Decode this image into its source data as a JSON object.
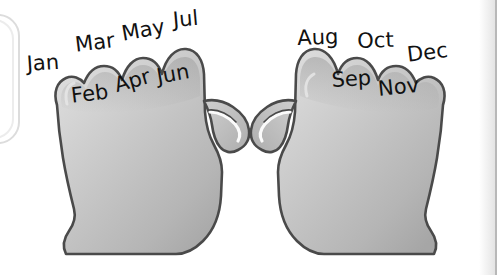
{
  "figure": {
    "colors": {
      "hand_fill_light": "#d2d2d2",
      "hand_fill_mid": "#bdbdbd",
      "hand_fill_dark": "#a8a8a8",
      "hand_outline": "#4a4a4a",
      "label_text": "#111111",
      "background": "#ffffff",
      "page_rule": "#b8b8b8"
    }
  },
  "left_hand": {
    "name": "left-fist",
    "labels": [
      {
        "id": "jan",
        "text": "Jan",
        "x": 26,
        "y": 54,
        "size": 21,
        "rotate": -4,
        "position": "knuckle"
      },
      {
        "id": "feb",
        "text": "Feb",
        "x": 70,
        "y": 86,
        "size": 21,
        "rotate": -7,
        "position": "valley"
      },
      {
        "id": "mar",
        "text": "Mar",
        "x": 74,
        "y": 35,
        "size": 21,
        "rotate": -7,
        "position": "knuckle"
      },
      {
        "id": "apr",
        "text": "Apr",
        "x": 112,
        "y": 76,
        "size": 21,
        "rotate": -16,
        "position": "valley"
      },
      {
        "id": "may",
        "text": "May",
        "x": 120,
        "y": 24,
        "size": 21,
        "rotate": -10,
        "position": "knuckle"
      },
      {
        "id": "jun",
        "text": "Jun",
        "x": 155,
        "y": 67,
        "size": 21,
        "rotate": -10,
        "position": "valley"
      },
      {
        "id": "jul",
        "text": "Jul",
        "x": 172,
        "y": 10,
        "size": 21,
        "rotate": -5,
        "position": "knuckle"
      }
    ]
  },
  "right_hand": {
    "name": "right-fist",
    "labels": [
      {
        "id": "aug",
        "text": "Aug",
        "x": 297,
        "y": 28,
        "size": 21,
        "rotate": -2,
        "position": "knuckle"
      },
      {
        "id": "sep",
        "text": "Sep",
        "x": 331,
        "y": 70,
        "size": 21,
        "rotate": -3,
        "position": "valley"
      },
      {
        "id": "oct",
        "text": "Oct",
        "x": 357,
        "y": 31,
        "size": 21,
        "rotate": -2,
        "position": "knuckle"
      },
      {
        "id": "nov",
        "text": "Nov",
        "x": 377,
        "y": 79,
        "size": 21,
        "rotate": -6,
        "position": "valley"
      },
      {
        "id": "dec",
        "text": "Dec",
        "x": 406,
        "y": 45,
        "size": 21,
        "rotate": -7,
        "position": "knuckle"
      }
    ]
  },
  "chart_data": {
    "type": "diagram",
    "categories": [
      "Jan",
      "Feb",
      "Mar",
      "Apr",
      "May",
      "Jun",
      "Jul",
      "Aug",
      "Sep",
      "Oct",
      "Nov",
      "Dec"
    ],
    "series": [
      {
        "name": "knuckle position",
        "values": [
          "knuckle",
          "valley",
          "knuckle",
          "valley",
          "knuckle",
          "valley",
          "knuckle",
          "knuckle",
          "valley",
          "knuckle",
          "valley",
          "knuckle"
        ]
      },
      {
        "name": "hand",
        "values": [
          "left",
          "left",
          "left",
          "left",
          "left",
          "left",
          "left",
          "right",
          "right",
          "right",
          "right",
          "right"
        ]
      }
    ],
    "legend": [
      "knuckle = 31 days",
      "valley = 30 or fewer days"
    ],
    "grid": false
  }
}
